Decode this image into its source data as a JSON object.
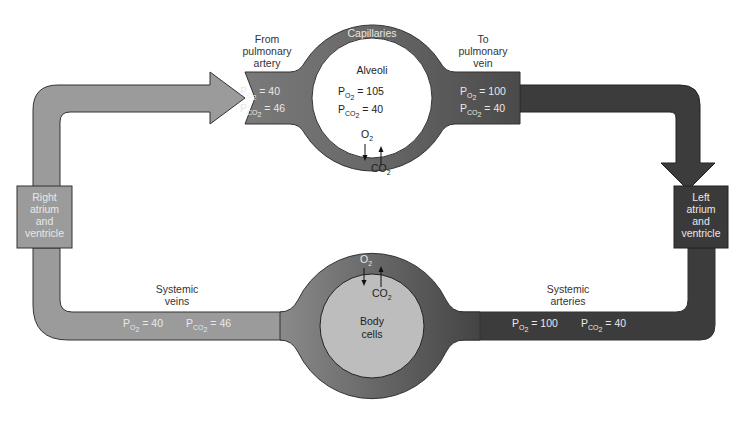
{
  "colors": {
    "venous": "#9b9b9b",
    "arterial": "#3c3c3c",
    "capillary_ring": "#666666",
    "body_cells": "#bdbdbd",
    "alveoli": "#ffffff",
    "outline": "#222222"
  },
  "pulmonary": {
    "capillaries_label": "Capillaries",
    "alveoli_label": "Alveoli",
    "alveoli_po2": "= 105",
    "alveoli_pco2": "= 40",
    "from_label": [
      "From",
      "pulmonary",
      "artery"
    ],
    "from_po2": "= 40",
    "from_pco2": "= 46",
    "to_label": [
      "To",
      "pulmonary",
      "vein"
    ],
    "to_po2": "= 100",
    "to_pco2": "= 40",
    "o2": "O",
    "co2": "CO"
  },
  "systemic": {
    "veins_label": [
      "Systemic",
      "veins"
    ],
    "veins_po2": "= 40",
    "veins_pco2": "= 46",
    "arteries_label": [
      "Systemic",
      "arteries"
    ],
    "arteries_po2": "= 100",
    "arteries_pco2": "= 40",
    "body_label": [
      "Body",
      "cells"
    ],
    "o2": "O",
    "co2": "CO"
  },
  "heart": {
    "right": [
      "Right",
      "atrium",
      "and",
      "ventricle"
    ],
    "left": [
      "Left",
      "atrium",
      "and",
      "ventricle"
    ]
  },
  "symbols": {
    "P": "P",
    "O2_sub": "O",
    "CO2_sub": "CO",
    "two": "2"
  }
}
